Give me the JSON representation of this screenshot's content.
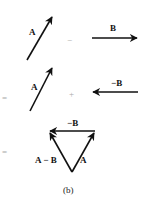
{
  "figure": {
    "caption": "(b)",
    "row1": {
      "vector_a_label": "A",
      "operator": "−",
      "vector_b_label": "B"
    },
    "row2": {
      "equals": "=",
      "vector_a_label": "A",
      "operator": "+",
      "vector_neg_b_label": "−B"
    },
    "row3": {
      "equals": "=",
      "top_label": "−B",
      "left_label": "A − B",
      "right_label": "A"
    },
    "colors": {
      "ink": "#111111",
      "operator": "#aaaaaa"
    }
  }
}
